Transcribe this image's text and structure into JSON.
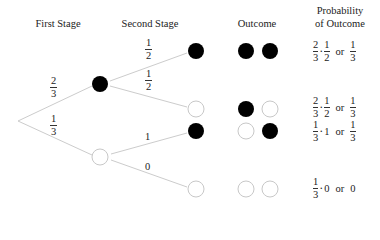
{
  "headers": {
    "first_stage": "First Stage",
    "second_stage": "Second Stage",
    "outcome": "Outcome",
    "probability_line1": "Probability",
    "probability_line2": "of Outcome"
  },
  "colors": {
    "branch": "#cccccc",
    "black_ball": "#000000",
    "white_ball_stroke": "#c8c8c8"
  },
  "first_stage": {
    "black_branch": {
      "num": "2",
      "den": "3"
    },
    "white_branch": {
      "num": "1",
      "den": "3"
    }
  },
  "second_stage": {
    "after_black": {
      "to_black": {
        "num": "1",
        "den": "2"
      },
      "to_white": {
        "num": "1",
        "den": "2"
      }
    },
    "after_white": {
      "to_black": "1",
      "to_white": "0"
    }
  },
  "outcomes": [
    {
      "balls": [
        "black",
        "black"
      ],
      "prob": {
        "a_num": "2",
        "a_den": "3",
        "b": {
          "num": "1",
          "den": "2"
        },
        "or": "or",
        "result": {
          "num": "1",
          "den": "3"
        }
      }
    },
    {
      "balls": [
        "black",
        "white"
      ],
      "prob": {
        "a_num": "2",
        "a_den": "3",
        "b": {
          "num": "1",
          "den": "2"
        },
        "or": "or",
        "result": {
          "num": "1",
          "den": "3"
        }
      }
    },
    {
      "balls": [
        "white",
        "black"
      ],
      "prob": {
        "a_num": "1",
        "a_den": "3",
        "b_whole": "1",
        "or": "or",
        "result": {
          "num": "1",
          "den": "3"
        }
      }
    },
    {
      "balls": [
        "white",
        "white"
      ],
      "prob": {
        "a_num": "1",
        "a_den": "3",
        "b_whole": "0",
        "or": "or",
        "result_whole": "0"
      }
    }
  ]
}
